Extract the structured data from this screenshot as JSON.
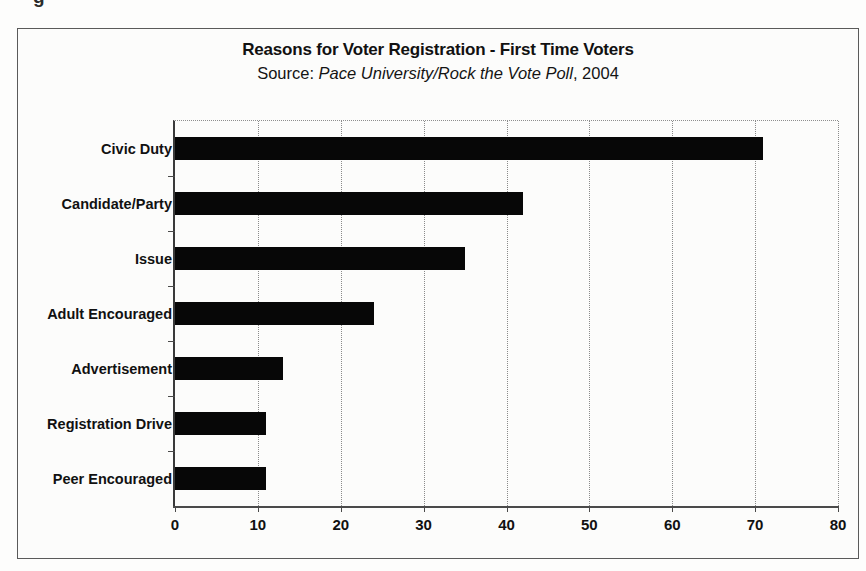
{
  "page": {
    "caption_remnant": "g"
  },
  "chart_data": {
    "type": "bar",
    "orientation": "horizontal",
    "title": "Reasons for Voter Registration - First Time Voters",
    "subtitle": {
      "prefix": "Source: ",
      "italic": "Pace University/Rock the Vote Poll",
      "suffix": ", 2004"
    },
    "categories": [
      "Civic Duty",
      "Candidate/Party",
      "Issue",
      "Adult Encouraged",
      "Advertisement",
      "Registration Drive",
      "Peer Encouraged"
    ],
    "values": [
      71,
      42,
      35,
      24,
      13,
      11,
      11
    ],
    "xlabel": "",
    "ylabel": "",
    "xlim": [
      0,
      80
    ],
    "xticks": [
      0,
      10,
      20,
      30,
      40,
      50,
      60,
      70,
      80
    ],
    "xtick_labels": [
      "0",
      "10",
      "20",
      "30",
      "40",
      "50",
      "60",
      "70",
      "80"
    ],
    "grid": "vertical-dotted",
    "legend": "none",
    "bar_color": "#070707",
    "frame_color": "#5a5a5a"
  }
}
